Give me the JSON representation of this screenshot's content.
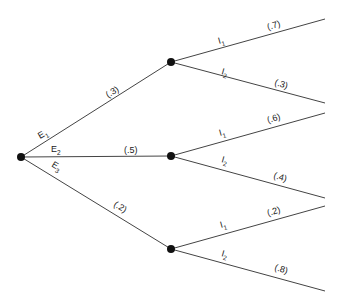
{
  "tree": {
    "root": {
      "x": 21,
      "y": 157
    },
    "first_level": [
      {
        "event": "E",
        "sub": "1",
        "prob": "(.3)",
        "node": {
          "x": 171,
          "y": 62
        },
        "branches": [
          {
            "label": "I",
            "sub": "1",
            "prob": "(.7)",
            "end": {
              "x": 325,
              "y": 19
            }
          },
          {
            "label": "I",
            "sub": "2",
            "prob": "(.3)",
            "end": {
              "x": 325,
              "y": 103
            }
          }
        ]
      },
      {
        "event": "E",
        "sub": "2",
        "prob": "(.5)",
        "node": {
          "x": 171,
          "y": 156
        },
        "branches": [
          {
            "label": "I",
            "sub": "1",
            "prob": "(.6)",
            "end": {
              "x": 325,
              "y": 113
            }
          },
          {
            "label": "I",
            "sub": "2",
            "prob": "(.4)",
            "end": {
              "x": 325,
              "y": 198
            }
          }
        ]
      },
      {
        "event": "E",
        "sub": "3",
        "prob": "(.2)",
        "node": {
          "x": 171,
          "y": 249
        },
        "branches": [
          {
            "label": "I",
            "sub": "1",
            "prob": "(.2)",
            "end": {
              "x": 325,
              "y": 206
            }
          },
          {
            "label": "I",
            "sub": "2",
            "prob": "(.8)",
            "end": {
              "x": 325,
              "y": 291
            }
          }
        ]
      }
    ]
  },
  "labels": {
    "e1": "E",
    "e1_sub": "1",
    "e2": "E",
    "e2_sub": "2",
    "e3": "E",
    "e3_sub": "3",
    "p_e1": "(.3)",
    "p_e2": "(.5)",
    "p_e3": "(.2)",
    "a_i1": "I",
    "a_i1_sub": "1",
    "a_i1_p": "(.7)",
    "a_i2": "I",
    "a_i2_sub": "2",
    "a_i2_p": "(.3)",
    "b_i1": "I",
    "b_i1_sub": "1",
    "b_i1_p": "(.6)",
    "b_i2": "I",
    "b_i2_sub": "2",
    "b_i2_p": "(.4)",
    "c_i1": "I",
    "c_i1_sub": "1",
    "c_i1_p": "(.2)",
    "c_i2": "I",
    "c_i2_sub": "2",
    "c_i2_p": "(.8)"
  },
  "colors": {
    "line": "#444444",
    "node": "#111111",
    "text": "#222222"
  }
}
